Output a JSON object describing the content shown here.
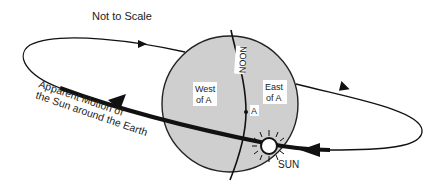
{
  "title": "Not to Scale",
  "globe": {
    "fill": "#cfcfcf",
    "stroke": "#222222",
    "meridian_label": "NOON",
    "west_label_line1": "West",
    "west_label_line2": "of A",
    "east_label_line1": "East",
    "east_label_line2": "of A",
    "point_label": "A"
  },
  "sun": {
    "label": "SUN"
  },
  "orbit": {
    "caption_line1": "Apparent Motion  of",
    "caption_line2": "the Sun around the Earth",
    "color": "#111111"
  }
}
